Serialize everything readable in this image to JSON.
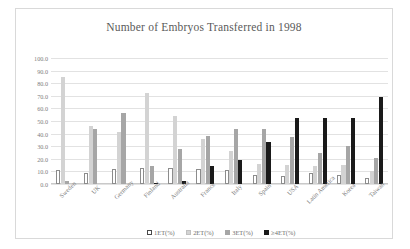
{
  "chart_data": {
    "type": "bar",
    "title": "Number of Embryos  Transferred  in 1998",
    "xlabel": "",
    "ylabel": "",
    "ylim": [
      0,
      100
    ],
    "yticks": [
      "0.0",
      "10.0",
      "20.0",
      "30.0",
      "40.0",
      "50.0",
      "60.0",
      "70.0",
      "80.0",
      "90.0",
      "100.0"
    ],
    "grid": true,
    "legend_position": "bottom",
    "categories": [
      "Sweden",
      "UK",
      "Germany",
      "Finland",
      "Australia",
      "France",
      "Italy",
      "Spain",
      "USA",
      "Latin America",
      "Korea",
      "Taiwan"
    ],
    "series": [
      {
        "name": "1ET(%)",
        "color": "#ffffff",
        "values": [
          11.0,
          9.0,
          12.0,
          13.0,
          13.0,
          12.0,
          11.0,
          7.0,
          6.0,
          9.0,
          7.0,
          5.0
        ]
      },
      {
        "name": "2ET(%)",
        "color": "#d3d3d3",
        "values": [
          85.0,
          46.0,
          41.0,
          72.0,
          54.0,
          36.0,
          26.0,
          16.0,
          15.0,
          14.0,
          15.0,
          10.0
        ]
      },
      {
        "name": "3ET(%)",
        "color": "#a6a6a6",
        "values": [
          2.0,
          44.0,
          56.0,
          14.0,
          28.0,
          38.0,
          44.0,
          44.0,
          37.0,
          25.0,
          30.0,
          21.0
        ]
      },
      {
        "name": "≥4ET(%)",
        "color": "#1a1a1a",
        "values": [
          0.0,
          0.0,
          0.0,
          1.0,
          2.0,
          14.0,
          19.0,
          33.0,
          52.0,
          52.0,
          52.0,
          69.0
        ]
      }
    ]
  }
}
